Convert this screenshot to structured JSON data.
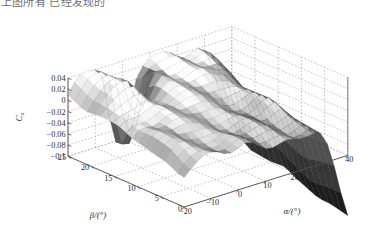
{
  "top_partial_text": "上图所有 已经发现的",
  "figure": {
    "type": "surface-plot-3d",
    "background_color": "#ffffff",
    "grid_color": "#9a9a9a",
    "axis_line_color": "#4d4d4d"
  },
  "axes": {
    "z": {
      "label": "C",
      "label_sub": "x",
      "ticks": [
        "0.04",
        "0.02",
        "0",
        "-0.02",
        "-0.04",
        "-0.06",
        "-0.08",
        "-0.1"
      ],
      "tick_values": [
        0.04,
        0.02,
        0,
        -0.02,
        -0.04,
        -0.06,
        -0.08,
        -0.1
      ],
      "range": [
        -0.1,
        0.04
      ]
    },
    "beta": {
      "label": "β/(°)",
      "ticks": [
        "25",
        "20",
        "15",
        "10",
        "5",
        "0"
      ],
      "tick_values": [
        25,
        20,
        15,
        10,
        5,
        0
      ],
      "range": [
        0,
        25
      ]
    },
    "alpha": {
      "label": "α/(°)",
      "ticks": [
        "-20",
        "-10",
        "0",
        "10",
        "20",
        "30",
        "40"
      ],
      "tick_values": [
        -20,
        -10,
        0,
        10,
        20,
        30,
        40
      ],
      "range": [
        -20,
        40
      ]
    }
  },
  "chart_data": {
    "type": "surface",
    "title": "",
    "xlabel": "α/(°)",
    "ylabel": "β/(°)",
    "zlabel": "Cx",
    "grid": true,
    "legend": "none",
    "colormap": "gray",
    "xlim": [
      -20,
      40
    ],
    "ylim": [
      0,
      25
    ],
    "zlim": [
      -0.1,
      0.04
    ],
    "x": [
      -20,
      -10,
      0,
      10,
      20,
      30,
      40
    ],
    "y": [
      0,
      5,
      10,
      15,
      20,
      25
    ],
    "z": [
      [
        -0.012,
        -0.03,
        -0.05,
        -0.062,
        -0.058,
        -0.04,
        -0.1
      ],
      [
        -0.004,
        -0.024,
        -0.046,
        -0.058,
        -0.054,
        -0.034,
        -0.094
      ],
      [
        0.004,
        -0.016,
        -0.04,
        -0.052,
        -0.048,
        -0.026,
        -0.086
      ],
      [
        0.012,
        -0.008,
        -0.034,
        -0.046,
        -0.04,
        -0.018,
        -0.074
      ],
      [
        0.02,
        0.002,
        -0.026,
        -0.038,
        -0.03,
        -0.008,
        -0.06
      ],
      [
        0.03,
        0.014,
        -0.094,
        -0.028,
        -0.018,
        0.004,
        -0.044
      ]
    ]
  }
}
